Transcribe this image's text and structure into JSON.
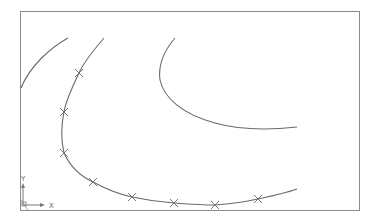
{
  "viewport": {
    "background": "#ffffff",
    "frame_color": "#8a8a8a",
    "curve_color": "#6a6a6a",
    "marker_color": "#6a6a6a"
  },
  "ucs_icon": {
    "x_label": "X",
    "y_label": "Y"
  },
  "curves": [
    {
      "name": "curve-left",
      "path": "M68,38 C50,48 30,66 21,88"
    },
    {
      "name": "curve-spline",
      "path": "M104,38 C92,52 82,66 79,73 C72,88 66,100 64,112 C61,126 61,140 64,153 C70,166 80,176 93,182 C106,189 118,194 132,197 C146,200 160,202 174,203 C188,204 202,205 215,205 C229,204 244,202 258,199 C272,196 286,193 297,189"
    },
    {
      "name": "curve-right",
      "path": "M175,38 C163,52 158,66 160,80 C164,98 182,114 215,123 C240,130 270,130 297,127"
    }
  ],
  "markers": [
    {
      "x": 79,
      "y": 73
    },
    {
      "x": 64,
      "y": 112
    },
    {
      "x": 64,
      "y": 153
    },
    {
      "x": 93,
      "y": 182
    },
    {
      "x": 132,
      "y": 197
    },
    {
      "x": 174,
      "y": 203
    },
    {
      "x": 215,
      "y": 205
    },
    {
      "x": 258,
      "y": 199
    }
  ]
}
